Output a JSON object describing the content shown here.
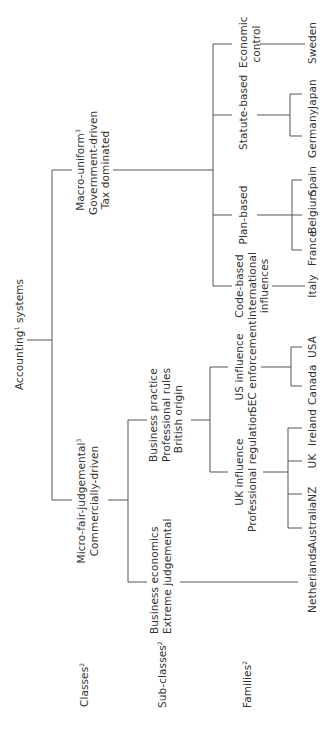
{
  "diagram": {
    "root": {
      "text": "Accounting",
      "sup": "1",
      "suffix": " systems"
    },
    "level_labels": {
      "classes": {
        "text": "Classes",
        "sup": "2"
      },
      "subclasses": {
        "text": "Sub-classes",
        "sup": "2"
      },
      "families": {
        "text": "Families",
        "sup": "2"
      }
    },
    "classes": {
      "micro": {
        "line1": "Micro-fair-judgemental",
        "sup": "3",
        "line2": "Commercially-driven"
      },
      "macro": {
        "line1": "Macro-uniform",
        "sup": "3",
        "line2": "Government-driven",
        "line3": "Tax dominated"
      }
    },
    "subclasses": {
      "business_economics": {
        "line1": "Business economics",
        "line2": "Extreme judgemental"
      },
      "business_practice": {
        "line1": "Business practice",
        "line2": "Professional rules",
        "line3": "British origin"
      },
      "code_based": {
        "line1": "Code-based",
        "line2": "international",
        "line3": "influences"
      },
      "plan_based": {
        "line1": "Plan-based"
      },
      "statute_based": {
        "line1": "Statute-based"
      },
      "economic_control": {
        "line1": "Economic",
        "line2": "control"
      }
    },
    "families": {
      "uk_influence": {
        "line1": "UK influence",
        "line2": "Professional regulation"
      },
      "us_influence": {
        "line1": "US influence",
        "line2": "SEC enforcement"
      }
    },
    "countries": {
      "netherlands": "Netherlands",
      "australia": "Australia",
      "nz": "NZ",
      "uk": "UK",
      "ireland": "Ireland",
      "canada": "Canada",
      "usa": "USA",
      "italy": "Italy",
      "france": "France",
      "belgium": "Belgium",
      "spain": "Spain",
      "germany": "Germany",
      "japan": "Japan",
      "sweden": "Sweden"
    }
  }
}
